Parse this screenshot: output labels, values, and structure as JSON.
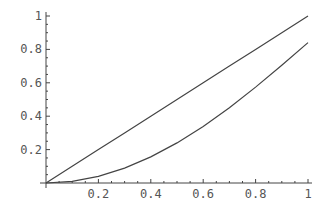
{
  "chart_data": {
    "type": "line",
    "title": "",
    "xlabel": "",
    "ylabel": "",
    "xlim": [
      0,
      1
    ],
    "ylim": [
      0,
      1
    ],
    "grid": false,
    "legend": null,
    "x_ticks": [
      0.2,
      0.4,
      0.6,
      0.8,
      1
    ],
    "x_tick_labels": [
      "0.2",
      "0.4",
      "0.6",
      "0.8",
      "1"
    ],
    "y_ticks": [
      0.2,
      0.4,
      0.6,
      0.8,
      1
    ],
    "y_tick_labels": [
      "0.2",
      "0.4",
      "0.6",
      "0.8",
      "1"
    ],
    "x": [
      0,
      0.1,
      0.2,
      0.3,
      0.4,
      0.5,
      0.6,
      0.7,
      0.8,
      0.9,
      1.0
    ],
    "series": [
      {
        "name": "upper curve",
        "values": [
          0,
          0.1,
          0.2,
          0.3,
          0.4,
          0.5,
          0.6,
          0.7,
          0.8,
          0.9,
          1.0
        ]
      },
      {
        "name": "lower curve",
        "values": [
          0,
          0.01,
          0.04,
          0.089,
          0.156,
          0.24,
          0.339,
          0.451,
          0.574,
          0.705,
          0.841
        ]
      }
    ],
    "colors": {
      "line": "#444444",
      "axis": "#444444",
      "text": "#555555",
      "background": "#ffffff"
    }
  }
}
